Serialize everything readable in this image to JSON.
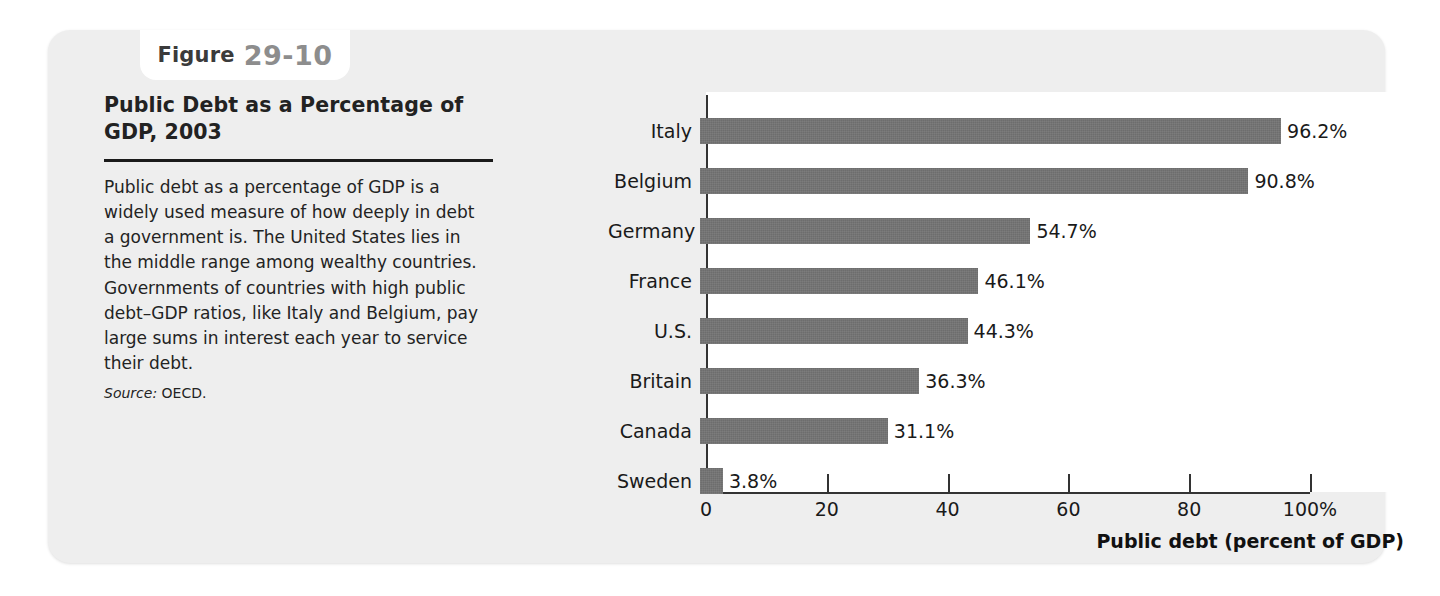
{
  "figure": {
    "tab_word": "Figure",
    "tab_number": "29-10",
    "title": "Public Debt as a Percentage of GDP, 2003",
    "body": "Public debt as a percentage of GDP is a widely used measure of how deeply in debt a government is. The United States lies in the middle range among wealthy countries. Governments of countries with high public debt–GDP ratios, like Italy and Belgium, pay large sums in interest each year to service their debt.",
    "source_label": "Source:",
    "source_value": "OECD.",
    "panel_color": "#eeeeee",
    "bar_color": "#6d6d6d",
    "axis_color": "#333333"
  },
  "chart_data": {
    "type": "bar",
    "orientation": "horizontal",
    "title": "Public Debt as a Percentage of GDP, 2003",
    "xlabel": "Public debt (percent of GDP)",
    "ylabel": "",
    "categories": [
      "Italy",
      "Belgium",
      "Germany",
      "France",
      "U.S.",
      "Britain",
      "Canada",
      "Sweden"
    ],
    "values": [
      96.2,
      90.8,
      54.7,
      46.1,
      44.3,
      36.3,
      31.1,
      3.8
    ],
    "value_labels": [
      "96.2%",
      "90.8%",
      "54.7%",
      "46.1%",
      "44.3%",
      "36.3%",
      "31.1%",
      "3.8%"
    ],
    "xlim": [
      0,
      100
    ],
    "xticks": [
      0,
      20,
      40,
      60,
      80,
      100
    ],
    "xticklabels": [
      "0",
      "20",
      "40",
      "60",
      "80",
      "100%"
    ],
    "grid": false,
    "legend": null,
    "source": "OECD."
  }
}
